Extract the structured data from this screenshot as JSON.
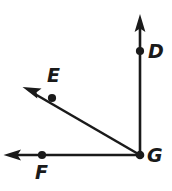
{
  "figure": {
    "background_color": "#ffffff",
    "stroke_color": "#1a1a1a",
    "label_color": "#1a1a1a",
    "vertex": {
      "name": "G",
      "label": "G",
      "x": 140,
      "y": 155
    },
    "rays": [
      {
        "name": "ray-GD",
        "from": "G",
        "through_point": "D",
        "start_x": 140,
        "start_y": 155,
        "end_x": 140,
        "end_y": 16,
        "direction": "up",
        "arrowhead": true
      },
      {
        "name": "ray-GE",
        "from": "G",
        "through_point": "E",
        "start_x": 140,
        "start_y": 155,
        "end_x": 24,
        "end_y": 88,
        "direction": "upper-left",
        "arrowhead": true
      },
      {
        "name": "ray-GF",
        "from": "G",
        "through_point": "F",
        "start_x": 140,
        "start_y": 155,
        "end_x": 5,
        "end_y": 155,
        "direction": "left",
        "arrowhead": true
      }
    ],
    "points": [
      {
        "name": "point-D",
        "label": "D",
        "x": 140,
        "y": 51,
        "label_x": 148,
        "label_y": 42,
        "dot": true
      },
      {
        "name": "point-E",
        "label": "E",
        "x": 52,
        "y": 98,
        "label_x": 47,
        "label_y": 66,
        "dot": true
      },
      {
        "name": "point-F",
        "label": "F",
        "x": 42,
        "y": 155,
        "label_x": 35,
        "label_y": 163,
        "dot": true
      },
      {
        "name": "point-G",
        "label": "G",
        "x": 140,
        "y": 155,
        "label_x": 147,
        "label_y": 146,
        "dot": true
      }
    ]
  }
}
